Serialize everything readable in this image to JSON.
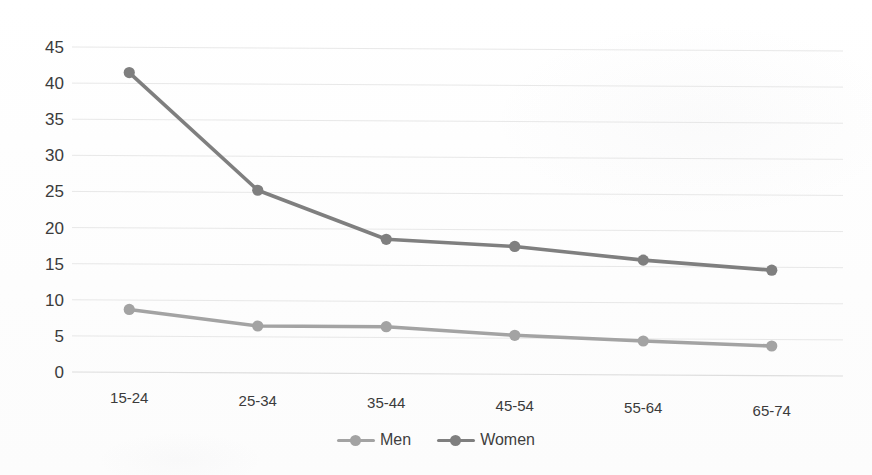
{
  "chart_data": {
    "type": "line",
    "title": "",
    "subtitle": "",
    "xlabel": "",
    "ylabel": "",
    "categories": [
      "15-24",
      "25-34",
      "35-44",
      "45-54",
      "55-64",
      "65-74"
    ],
    "series": [
      {
        "name": "Men",
        "color": "#a3a3a3",
        "values": [
          8.7,
          6.5,
          6.5,
          5.4,
          4.7,
          4.1
        ]
      },
      {
        "name": "Women",
        "color": "#7f7f7f",
        "values": [
          41.5,
          25.3,
          18.6,
          17.7,
          15.9,
          14.6
        ]
      }
    ],
    "ylim": [
      0,
      45
    ],
    "yticks": [
      0,
      5,
      10,
      15,
      20,
      25,
      30,
      35,
      40,
      45
    ],
    "ytick_labels": [
      "0",
      "5",
      "10",
      "15",
      "20",
      "25",
      "30",
      "35",
      "40",
      "45"
    ],
    "grid": true,
    "grid_axis": "y",
    "grid_color": "#d9d9d9",
    "legend_position": "bottom-center",
    "legend_entries": [
      "Men",
      "Women"
    ],
    "markers": true,
    "marker_shape": "circle",
    "background": "#ffffff"
  },
  "legend": {
    "items": [
      {
        "label": "Men",
        "marker_name": "legend-marker-men"
      },
      {
        "label": "Women",
        "marker_name": "legend-marker-women"
      }
    ]
  }
}
